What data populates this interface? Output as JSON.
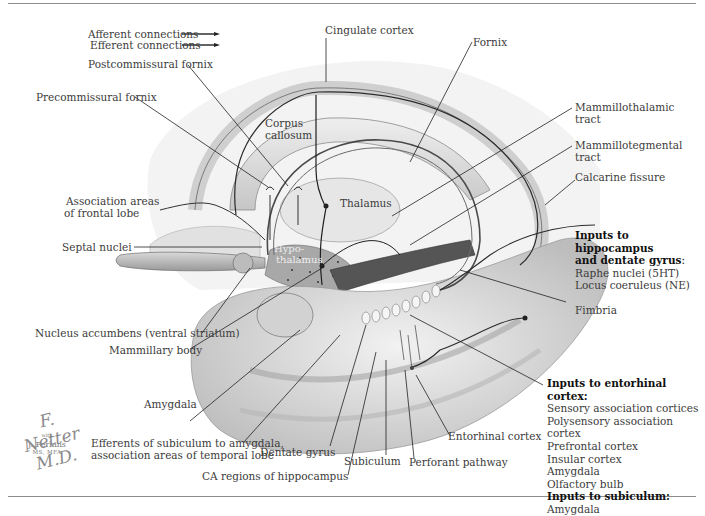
{
  "figure": {
    "legend": {
      "afferent": "Afferent connections",
      "efferent": "Efferent connections"
    },
    "labels": {
      "cingulate_cortex": "Cingulate cortex",
      "fornix": "Fornix",
      "postcommissural_fornix": "Postcommissural fornix",
      "precommissural_fornix": "Precommissural fornix",
      "corpus_callosum_1": "Corpus",
      "corpus_callosum_2": "callosum",
      "mammillothalamic_1": "Mammillothalamic",
      "mammillothalamic_2": "tract",
      "mammillotegmental_1": "Mammillotegmental",
      "mammillotegmental_2": "tract",
      "calcarine_fissure": "Calcarine fissure",
      "association_frontal_1": "Association areas",
      "association_frontal_2": "of frontal lobe",
      "thalamus": "Thalamus",
      "septal_nuclei": "Septal nuclei",
      "hypothalamus_1": "Hypo-",
      "hypothalamus_2": "thalamus",
      "fimbria": "Fimbria",
      "nucleus_accumbens": "Nucleus accumbens (ventral striatum)",
      "mammillary_body": "Mammillary body",
      "amygdala": "Amygdala",
      "efferents_subiculum_1": "Efferents of subiculum to amygdala,",
      "efferents_subiculum_2": "association areas of temporal lobe",
      "dentate_gyrus": "Dentate gyrus",
      "ca_regions": "CA regions of hippocampus",
      "subiculum": "Subiculum",
      "perforant_pathway": "Perforant pathway",
      "entorhinal_cortex": "Entorhinal cortex"
    },
    "inputs_hippocampus": {
      "heading_1": "Inputs to hippocampus",
      "heading_2": "and dentate gyrus",
      "colon": ":",
      "items": [
        "Raphe nuclei (5HT)",
        "Locus coeruleus (NE)"
      ]
    },
    "inputs_entorhinal": {
      "heading": "Inputs to entorhinal cortex:",
      "items": [
        "Sensory association cortices",
        "Polysensory association cortex",
        "Prefrontal cortex",
        "Insular cortex",
        "Amygdala",
        "Olfactory bulb"
      ]
    },
    "inputs_subiculum": {
      "heading": "Inputs to subiculum:",
      "items": [
        "Amygdala"
      ]
    },
    "signature": {
      "artist": "F. Netter M.D.",
      "with": "with",
      "name": "J. Perkins",
      "degree": "MS, MFA"
    },
    "colors": {
      "line": "#2a2a2a",
      "text": "#3b3b3b",
      "rule": "#8c8c8c"
    }
  }
}
